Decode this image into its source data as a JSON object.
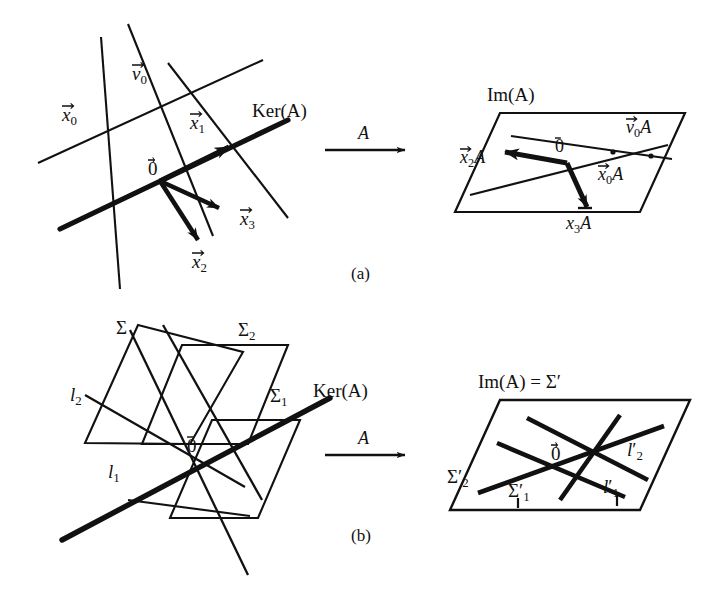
{
  "figure": {
    "title_absent": true,
    "captions": [
      {
        "id": "a",
        "text": "(a)"
      },
      {
        "id": "b",
        "text": "(b)"
      }
    ],
    "maps": [
      {
        "id": "map-a",
        "label": "A",
        "panel": "a"
      },
      {
        "id": "map-b",
        "label": "A",
        "panel": "b"
      }
    ]
  },
  "panel_a": {
    "source": {
      "kernel_label": "Ker(A)",
      "origin_label": "0",
      "vectors": [
        {
          "name": "v0",
          "base": "v",
          "sub": "0"
        },
        {
          "name": "x0",
          "base": "x",
          "sub": "0"
        },
        {
          "name": "x1",
          "base": "x",
          "sub": "1"
        },
        {
          "name": "x2",
          "base": "x",
          "sub": "2"
        },
        {
          "name": "x3",
          "base": "x",
          "sub": "3"
        }
      ]
    },
    "target": {
      "image_label": "Im(A)",
      "origin_label": "0",
      "vectors": [
        {
          "name": "v0A",
          "base": "v",
          "sub": "0",
          "suffix": "A"
        },
        {
          "name": "x0A",
          "base": "x",
          "sub": "0",
          "suffix": "A"
        },
        {
          "name": "x2A",
          "base": "x",
          "sub": "2",
          "suffix": "A"
        },
        {
          "name": "x3A",
          "base": "x",
          "sub": "3",
          "suffix": "A"
        }
      ]
    }
  },
  "panel_b": {
    "source": {
      "kernel_label": "Ker(A)",
      "origin_label": "0",
      "planes": [
        {
          "name": "Sigma",
          "symbol": "Σ",
          "sub": ""
        },
        {
          "name": "Sigma1",
          "symbol": "Σ",
          "sub": "1"
        },
        {
          "name": "Sigma2",
          "symbol": "Σ",
          "sub": "2"
        }
      ],
      "lines": [
        {
          "name": "l1",
          "base": "l",
          "sub": "1"
        },
        {
          "name": "l2",
          "base": "l",
          "sub": "2"
        }
      ]
    },
    "target": {
      "image_label_prefix": "Im(A)",
      "image_label_equals": "=",
      "image_label_value": "Σ′",
      "origin_label": "0",
      "planes": [
        {
          "name": "Sigma1p",
          "symbol": "Σ",
          "sub": "1",
          "prime": "′"
        },
        {
          "name": "Sigma2p",
          "symbol": "Σ",
          "sub": "2",
          "prime": "′"
        }
      ],
      "lines": [
        {
          "name": "l1p",
          "base": "l",
          "sub": "1",
          "prime": "′"
        },
        {
          "name": "l2p",
          "base": "l",
          "sub": "2",
          "prime": "′"
        }
      ]
    }
  },
  "style": {
    "ink": "#111111",
    "background": "#ffffff"
  }
}
